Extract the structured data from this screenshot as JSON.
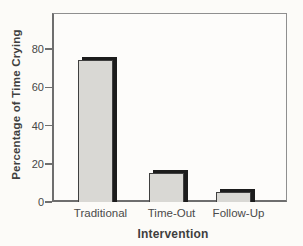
{
  "figure": {
    "background": "#fcfbf8",
    "bar_fill": "#d9d8d4",
    "bar_edge_color": "#1c1c1c",
    "bar_outline_color": "#3f3f3f",
    "frame_color": "#8f8f8f",
    "text_color": "#3f3f3f"
  },
  "chart_data": {
    "type": "bar",
    "title": "",
    "categories": [
      "Traditional",
      "Time-Out",
      "Follow-Up"
    ],
    "values": [
      74,
      15,
      5
    ],
    "xlabel": "Intervention",
    "ylabel": "Percentage of Time Crying",
    "yticks": [
      0,
      20,
      40,
      60,
      80
    ],
    "ylim": [
      0,
      99
    ],
    "grid": false,
    "legend": null
  }
}
